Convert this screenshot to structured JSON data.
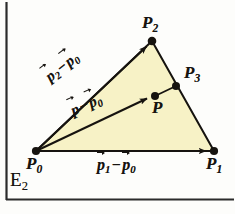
{
  "figure": {
    "space_label": "E",
    "space_label_sub": "2",
    "fill_color": "#f7f2c6",
    "stroke_color": "#16130f",
    "background_color": "#fdfdfb",
    "border_color": "#2b2b2b"
  },
  "points": {
    "p0": {
      "label": "P",
      "sub": "0",
      "x": 36,
      "y": 151
    },
    "p1": {
      "label": "P",
      "sub": "1",
      "x": 214,
      "y": 151
    },
    "p2": {
      "label": "P",
      "sub": "2",
      "x": 152,
      "y": 41
    },
    "p3": {
      "label": "P",
      "sub": "3",
      "x": 176,
      "y": 86
    },
    "p": {
      "label": "P",
      "sub": "",
      "x": 155,
      "y": 96
    }
  },
  "vectors": {
    "bottom": {
      "head": "p",
      "head_sub": "1",
      "operator": "−",
      "tail": "p",
      "tail_sub": "0"
    },
    "upper_edge": {
      "head": "p",
      "head_sub": "2",
      "operator": "−",
      "tail": "p",
      "tail_sub": "0"
    },
    "interior": {
      "head": "p",
      "head_sub": "",
      "operator": "−",
      "tail": "p",
      "tail_sub": "0"
    }
  }
}
